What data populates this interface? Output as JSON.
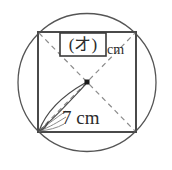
{
  "figure": {
    "background_color": "#ffffff",
    "stroke_color": "#4a4a4a",
    "dash_color": "#8c8c8c",
    "text_color": "#2b2b2b",
    "circle": {
      "center_x": 87,
      "center_y": 82.5,
      "radius": 69
    },
    "square": {
      "left": 38,
      "top": 32,
      "right": 136,
      "bottom": 132,
      "side_px": 98
    },
    "center_dot": {
      "x": 87,
      "y": 82
    }
  },
  "labels": {
    "answer_box": {
      "text": "(オ)",
      "unit": "cm"
    },
    "diagonal": {
      "value": "7",
      "unit": "cm",
      "full": "7 cm"
    }
  }
}
